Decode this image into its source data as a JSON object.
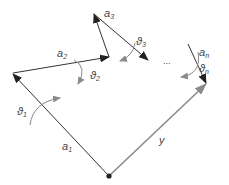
{
  "diagram": {
    "title": "",
    "colors": {
      "link": "#333333",
      "arrowhead": "#222222",
      "target": "#8a8a8a",
      "rotation": "#8a8a8a",
      "origin": "#222222",
      "label": "#444444"
    },
    "links": [
      {
        "id": "a1",
        "label": "a",
        "sub": "1"
      },
      {
        "id": "a2",
        "label": "a",
        "sub": "2"
      },
      {
        "id": "a3",
        "label": "a",
        "sub": "3"
      },
      {
        "id": "an",
        "label": "a",
        "sub": "n"
      }
    ],
    "angles": [
      {
        "id": "theta1",
        "label": "ϑ",
        "sub": "1"
      },
      {
        "id": "theta2",
        "label": "ϑ",
        "sub": "2"
      },
      {
        "id": "theta3",
        "label": "ϑ",
        "sub": "3"
      },
      {
        "id": "thetan",
        "label": "ϑ",
        "sub": "n"
      }
    ],
    "target": {
      "label": "y"
    },
    "ellipsis": "..."
  }
}
